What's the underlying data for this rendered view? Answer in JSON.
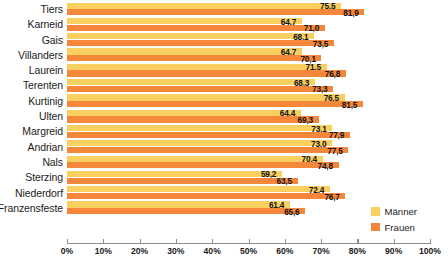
{
  "chart_data": {
    "type": "bar",
    "orientation": "horizontal",
    "title": "",
    "xlabel": "",
    "ylabel": "",
    "xlim": [
      0,
      100
    ],
    "grid": false,
    "legend_position": "right-bottom",
    "tick_labels": [
      "0%",
      "10%",
      "20%",
      "30%",
      "40%",
      "50%",
      "60%",
      "70%",
      "80%",
      "90%",
      "100%"
    ],
    "tick_values": [
      0,
      10,
      20,
      30,
      40,
      50,
      60,
      70,
      80,
      90,
      100
    ],
    "categories": [
      "Tiers",
      "Karneid",
      "Gais",
      "Villanders",
      "Laurein",
      "Terenten",
      "Kurtinig",
      "Ulten",
      "Margreid",
      "Andrian",
      "Nals",
      "Sterzing",
      "Niederdorf",
      "Franzensfeste"
    ],
    "series": [
      {
        "name": "Männer",
        "color": "#f9cf5f",
        "values": [
          75.5,
          64.7,
          68.1,
          64.7,
          71.5,
          68.3,
          76.5,
          64.4,
          73.1,
          73.0,
          70.4,
          59.2,
          72.4,
          61.4
        ],
        "labels": [
          "75,5",
          "64,7",
          "68,1",
          "64,7",
          "71,5",
          "68,3",
          "76,5",
          "64,4",
          "73,1",
          "73,0",
          "70,4",
          "59,2",
          "72,4",
          "61,4"
        ]
      },
      {
        "name": "Frauen",
        "color": "#f5873a",
        "values": [
          81.9,
          71.0,
          73.5,
          70.1,
          76.8,
          73.3,
          81.5,
          69.3,
          77.9,
          77.5,
          74.8,
          63.5,
          76.7,
          65.6
        ],
        "labels": [
          "81,9",
          "71,0",
          "73,5",
          "70,1",
          "76,8",
          "73,3",
          "81,5",
          "69,3",
          "77,9",
          "77,5",
          "74,8",
          "63,5",
          "76,7",
          "65,6"
        ]
      }
    ]
  },
  "legend": {
    "items": [
      {
        "label": "Männer",
        "color": "#f9cf5f"
      },
      {
        "label": "Frauen",
        "color": "#f5873a"
      }
    ]
  }
}
